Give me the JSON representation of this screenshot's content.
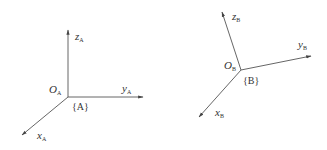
{
  "diagram": {
    "type": "coordinate-frames",
    "line_color": "#555555",
    "frames": [
      {
        "name": "A",
        "frame_label": "{A}",
        "origin": {
          "symbol": "O",
          "sub": "A"
        },
        "axes": {
          "x": {
            "symbol": "x",
            "sub": "A"
          },
          "y": {
            "symbol": "y",
            "sub": "A"
          },
          "z": {
            "symbol": "z",
            "sub": "A"
          }
        }
      },
      {
        "name": "B",
        "frame_label": "{B}",
        "origin": {
          "symbol": "O",
          "sub": "B"
        },
        "axes": {
          "x": {
            "symbol": "x",
            "sub": "B"
          },
          "y": {
            "symbol": "y",
            "sub": "B"
          },
          "z": {
            "symbol": "z",
            "sub": "B"
          }
        }
      }
    ]
  }
}
